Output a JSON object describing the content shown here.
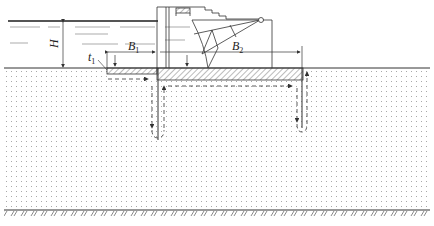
{
  "diagram": {
    "labels": {
      "H": "H",
      "B1_main": "B",
      "B1_sub": "1",
      "B2_main": "B",
      "B2_sub": "2",
      "t1_main": "t",
      "t1_sub": "1"
    },
    "colors": {
      "line": "#333333",
      "dots": "#9a9a9a",
      "water": "#777777"
    },
    "elements": [
      "water-surface",
      "ground-surface",
      "upstream-apron",
      "dam-slab",
      "upstream-cutoff-wall",
      "downstream-cutoff-wall",
      "gate-structure",
      "gate-arm",
      "seepage-flow-arrows",
      "bedrock-boundary"
    ]
  }
}
